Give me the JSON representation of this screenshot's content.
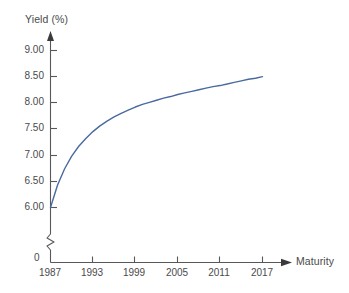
{
  "chart_data": {
    "type": "line",
    "title": "",
    "xlabel": "Maturity",
    "ylabel": "Yield (%)",
    "x": [
      1987,
      1988,
      1989,
      1990,
      1991,
      1992,
      1993,
      1994,
      1995,
      1996,
      1997,
      1998,
      1999,
      2000,
      2001,
      2002,
      2003,
      2004,
      2005,
      2006,
      2007,
      2008,
      2009,
      2010,
      2011,
      2012,
      2013,
      2014,
      2015,
      2016,
      2017
    ],
    "values": [
      6.0,
      6.43,
      6.74,
      6.98,
      7.17,
      7.32,
      7.45,
      7.56,
      7.65,
      7.73,
      7.8,
      7.86,
      7.92,
      7.97,
      8.01,
      8.05,
      8.09,
      8.12,
      8.16,
      8.19,
      8.22,
      8.25,
      8.28,
      8.31,
      8.33,
      8.36,
      8.39,
      8.42,
      8.45,
      8.47,
      8.5
    ],
    "series": [
      {
        "name": "Yield curve",
        "color": "#4a6a9e",
        "values": [
          6.0,
          6.43,
          6.74,
          6.98,
          7.17,
          7.32,
          7.45,
          7.56,
          7.65,
          7.73,
          7.8,
          7.86,
          7.92,
          7.97,
          8.01,
          8.05,
          8.09,
          8.12,
          8.16,
          8.19,
          8.22,
          8.25,
          8.28,
          8.31,
          8.33,
          8.36,
          8.39,
          8.42,
          8.45,
          8.47,
          8.5
        ]
      }
    ],
    "xtick_labels": [
      "1987",
      "1993",
      "1999",
      "2005",
      "2011",
      "2017"
    ],
    "xtick_values": [
      1987,
      1993,
      1999,
      2005,
      2011,
      2017
    ],
    "ytick_labels": [
      "9.00",
      "8.50",
      "8.00",
      "7.50",
      "7.00",
      "6.50",
      "6.00"
    ],
    "ytick_values": [
      9.0,
      8.5,
      8.0,
      7.5,
      7.0,
      6.5,
      6.0
    ],
    "origin_label": "0",
    "ylim": [
      6.0,
      9.0
    ],
    "xlim": [
      1987,
      2017
    ],
    "grid": false,
    "legend": "none",
    "y_axis_break": true,
    "annotations": []
  },
  "axes": {
    "y_title": "Yield (%)",
    "x_title": "Maturity",
    "axis_color": "#58585a",
    "line_color": "#4a6a9e"
  }
}
